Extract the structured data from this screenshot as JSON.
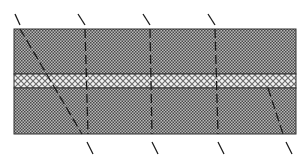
{
  "diagram": {
    "type": "layered-band-schematic",
    "width": 306,
    "height": 164,
    "colors": {
      "background": "#ffffff",
      "band_outline": "#333333",
      "dark_hatch_fg": "#4a4a4a",
      "dark_hatch_bg": "#b8b8b8",
      "light_hatch_fg": "#6a6a6a",
      "light_hatch_bg": "#f2f2f2",
      "dash_line": "#1a1a1a"
    },
    "band_x": [
      14,
      296
    ],
    "bands": [
      {
        "name": "upper-dark-band",
        "pattern": "dense-checker",
        "y0": 29,
        "y1": 74
      },
      {
        "name": "middle-light-band",
        "pattern": "light-crosshatch",
        "y0": 74,
        "y1": 88
      },
      {
        "name": "lower-dark-band",
        "pattern": "dense-checker",
        "y0": 88,
        "y1": 134
      }
    ],
    "diagonal_lines": [
      {
        "top_tick": [
          15,
          14,
          20,
          25
        ],
        "dashed": [
          20,
          29,
          82,
          134
        ],
        "bottom_tick": null
      },
      {
        "top_tick": [
          78,
          14,
          85,
          25
        ],
        "dashed": [
          85,
          29,
          88,
          134
        ],
        "bottom_tick": [
          87,
          142,
          93,
          154
        ]
      },
      {
        "top_tick": [
          143,
          14,
          150,
          25
        ],
        "dashed": [
          150,
          29,
          152,
          134
        ],
        "bottom_tick": [
          152,
          142,
          158,
          154
        ]
      },
      {
        "top_tick": [
          208,
          14,
          215,
          25
        ],
        "dashed": [
          215,
          29,
          218,
          134
        ],
        "bottom_tick": [
          218,
          142,
          224,
          154
        ]
      },
      {
        "top_tick": null,
        "dashed": [
          268,
          88,
          283,
          134
        ],
        "bottom_tick": [
          286,
          142,
          292,
          154
        ]
      }
    ]
  }
}
